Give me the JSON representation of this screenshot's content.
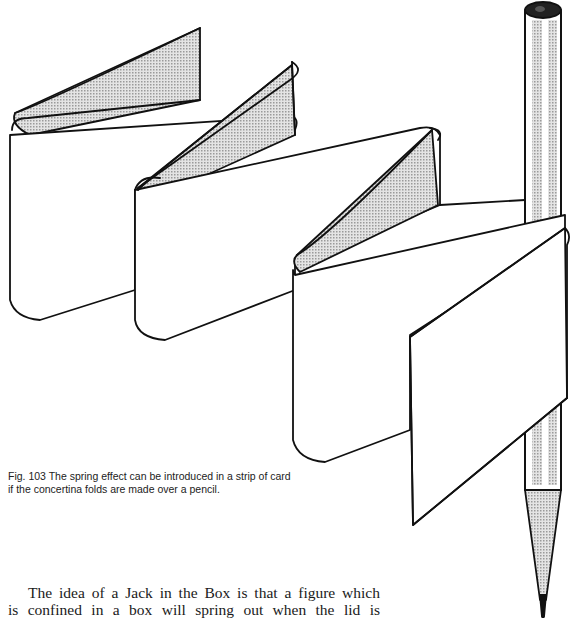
{
  "figure": {
    "label": "Fig. 103",
    "caption_line1": "Fig. 103 The spring effect can be introduced in a strip of card",
    "caption_line2": "if the concertina folds are made over a pencil.",
    "elements": [
      "concertina-folded-card-strip",
      "pencil"
    ],
    "shade_color": "#c8c8c8",
    "line_color": "#111111"
  },
  "body": {
    "line1": "The idea of a Jack in the Box is that a figure which",
    "line2": "is confined in a box will spring out when the lid is"
  }
}
